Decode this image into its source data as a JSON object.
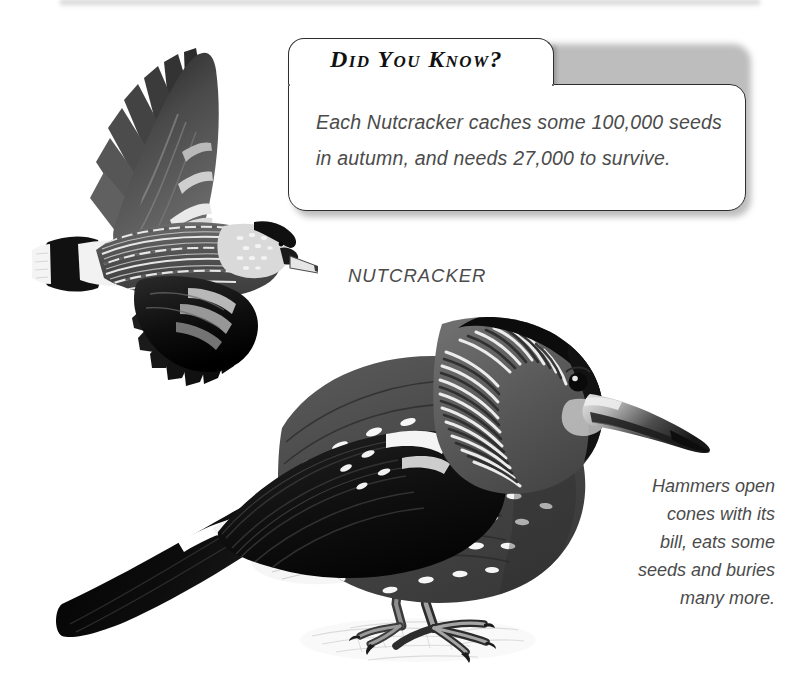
{
  "page": {
    "background_color": "#ffffff",
    "text_color": "#4b4b4b",
    "heading_color": "#111111",
    "outline_color": "#2e2e2e",
    "width": 787,
    "height": 680
  },
  "callout": {
    "title": "Did You Know?",
    "line1": "Each Nutcracker caches some 100,000 seeds",
    "line2": "in autumn, and needs 27,000 to survive.",
    "facts": {
      "seeds_cached": "100,000",
      "seeds_needed_to_survive": "27,000",
      "season": "autumn"
    }
  },
  "species_label": "NUTCRACKER",
  "side_caption": {
    "lines": [
      "Hammers open",
      "cones with its",
      "bill, eats some",
      "seeds and buries",
      "many more."
    ]
  },
  "illustrations": {
    "flying_bird": {
      "name": "Nutcracker in flight",
      "alt": "grayscale illustration of a nutcracker flying with wings spread, barred body, black wings, white-tipped tail"
    },
    "perched_bird": {
      "name": "Nutcracker perched",
      "alt": "grayscale illustration of a nutcracker standing on the ground, white-spotted brown body, black crown, long dark bill, black tail with white undertail"
    }
  }
}
